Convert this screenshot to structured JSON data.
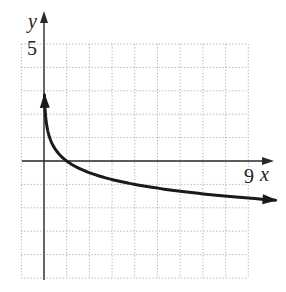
{
  "chart_data": {
    "type": "line",
    "title": "",
    "xlabel": "x",
    "ylabel": "y",
    "xlim": [
      -1,
      9
    ],
    "ylim": [
      -5,
      5
    ],
    "grid": true,
    "grid_style": "dotted",
    "tick_labels": {
      "x": [
        "9"
      ],
      "y": [
        "5"
      ]
    },
    "series": [
      {
        "name": "y = -log_4(x)",
        "function": "-log4(x)",
        "x": [
          0.02,
          0.1,
          0.25,
          0.5,
          1,
          2,
          3,
          4,
          5,
          6,
          7,
          8,
          9,
          10.2
        ],
        "y": [
          2.82,
          1.66,
          1.0,
          0.5,
          0,
          -0.5,
          -0.79,
          -1.0,
          -1.16,
          -1.29,
          -1.4,
          -1.5,
          -1.58,
          -1.68
        ],
        "arrows": [
          "start",
          "end"
        ]
      }
    ],
    "axes_arrows": true
  },
  "labels": {
    "x_axis": "x",
    "y_axis": "y",
    "x_tick": "9",
    "y_tick": "5"
  },
  "colors": {
    "curve": "#1a1a1a",
    "axis": "#2a2a2a",
    "grid": "#9a9a9a"
  }
}
